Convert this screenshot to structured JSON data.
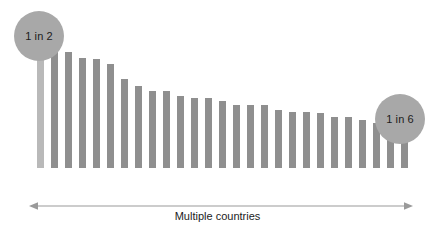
{
  "chart_data": {
    "type": "bar",
    "title": "",
    "subtitle": "",
    "xlabel": "Multiple countries",
    "ylabel": "",
    "grid": false,
    "legend_position": "none",
    "axis_range_note": "No numeric y-axis shown; bar heights are relative",
    "categories": [
      "C1",
      "C2",
      "C3",
      "C4",
      "C5",
      "C6",
      "C7",
      "C8",
      "C9",
      "C10",
      "C11",
      "C12",
      "C13",
      "C14",
      "C15",
      "C16",
      "C17",
      "C18",
      "C19",
      "C20",
      "C21",
      "C22",
      "C23",
      "C24",
      "C25",
      "C26",
      "C27"
    ],
    "values": [
      129,
      119,
      116,
      110,
      109,
      104,
      89,
      82,
      77,
      77,
      72,
      70,
      70,
      67,
      63,
      63,
      63,
      58,
      56,
      56,
      55,
      51,
      51,
      48,
      45,
      38,
      32
    ],
    "highlight_index": 0,
    "annotations": [
      {
        "text": "1 in 2",
        "target": "first-bar",
        "position": "top-left"
      },
      {
        "text": "1 in 6",
        "target": "last-bar",
        "position": "right"
      }
    ],
    "colors": {
      "bar": "#8f8f8f",
      "bar_highlight": "#b9b9b9",
      "bubble": "#a8a8a8",
      "text": "#1c1c1c",
      "axis": "#9a9a9a",
      "background": "#ffffff"
    }
  },
  "chart": {
    "axis": {
      "label": "Multiple countries",
      "arrow_icon": "double-headed-arrow-icon"
    },
    "bubbles": {
      "left_label": "1 in 2",
      "right_label": "1 in 6"
    }
  }
}
